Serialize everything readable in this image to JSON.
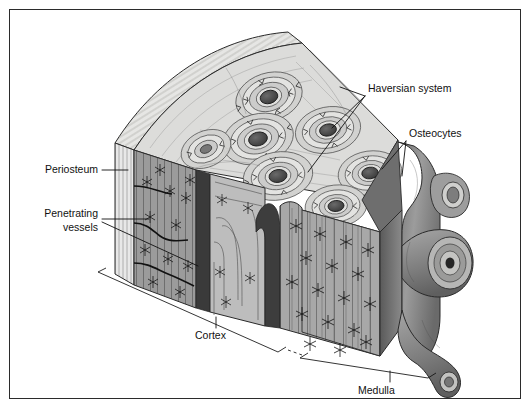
{
  "figure": {
    "background_color": "#ffffff",
    "frame_border_color": "#2b2b2b",
    "ink_color": "#111111"
  },
  "labels": {
    "haversian_system": "Haversian system",
    "osteocytes": "Osteocytes",
    "periosteum": "Periosteum",
    "penetrating_vessels_line1": "Penetrating",
    "penetrating_vessels_line2": "vessels",
    "cortex": "Cortex",
    "medulla": "Medulla"
  },
  "palette": {
    "periosteum_band": "#e2e2e2",
    "periosteum_stripe": "#9a9a9a",
    "top_surface": "#d8d8d6",
    "lamellae_light": "#dedede",
    "lamellae_mid": "#c2c2c2",
    "cortex_face": "#a9a9a9",
    "cortex_face_dark": "#8d8d8d",
    "canal_dark": "#3a3a3a",
    "haversian_canal": "#4a4a4a",
    "medulla_trabecula": "#7e7e7e",
    "medulla_shadow": "#5c5c5c",
    "outline": "#1a1a1a"
  },
  "structures": {
    "osteon_count": 7,
    "osteon_ring_count": 4,
    "volkmann_canal_count": 2,
    "trabecula_count": 3
  }
}
